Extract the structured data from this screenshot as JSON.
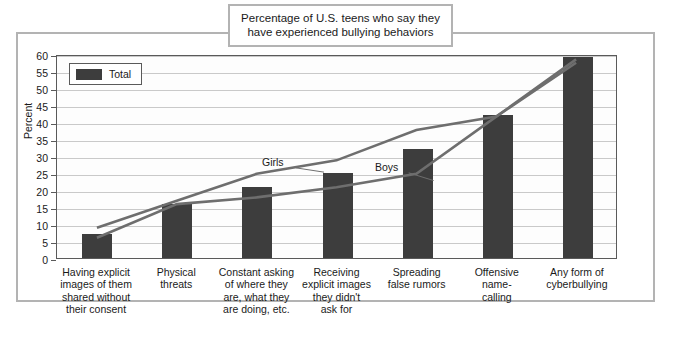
{
  "title": {
    "line1": "Percentage of U.S. teens who say they",
    "line2": "have experienced bullying behaviors"
  },
  "legend": {
    "label": "Total",
    "swatch_color": "#3d3d3d"
  },
  "annotations": {
    "girls": "Girls",
    "boys": "Boys"
  },
  "colors": {
    "bar": "#3d3d3d",
    "line": "#6e6e6e",
    "grid": "#c9c9c9",
    "frame": "#b3b3b3",
    "axis": "#5a5a5a"
  },
  "chart_data": {
    "type": "bar",
    "title": "Percentage of U.S. teens who say they have experienced bullying behaviors",
    "xlabel": "",
    "ylabel": "Percent",
    "ylim": [
      0,
      60
    ],
    "yticks": [
      0,
      5,
      10,
      15,
      20,
      25,
      30,
      35,
      40,
      45,
      50,
      55,
      60
    ],
    "grid": true,
    "legend_position": "top-left",
    "categories": [
      "Having explicit images of them shared without their consent",
      "Physical threats",
      "Constant asking of where they are, what they are doing, etc.",
      "Receiving explicit images they didn't ask for",
      "Spreading false rumors",
      "Offensive name-calling",
      "Any form of cyberbullying"
    ],
    "category_lines": [
      [
        "Having explicit",
        "images of them",
        "shared without",
        "their consent"
      ],
      [
        "Physical",
        "threats"
      ],
      [
        "Constant asking",
        "of where they",
        "are, what they",
        "are doing, etc."
      ],
      [
        "Receiving",
        "explicit images",
        "they didn't",
        "ask for"
      ],
      [
        "Spreading",
        "false rumors"
      ],
      [
        "Offensive",
        "name-",
        "calling"
      ],
      [
        "Any form of",
        "cyberbullying"
      ]
    ],
    "series": [
      {
        "name": "Total",
        "type": "bar",
        "values": [
          7,
          16,
          21,
          25,
          32,
          42,
          59
        ]
      },
      {
        "name": "Girls",
        "type": "line",
        "values": [
          9,
          17,
          25,
          29,
          38,
          42,
          59
        ]
      },
      {
        "name": "Boys",
        "type": "line",
        "values": [
          6,
          16,
          18,
          21,
          25,
          42,
          58
        ]
      }
    ]
  }
}
